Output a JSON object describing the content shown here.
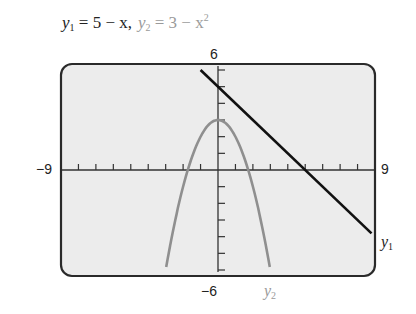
{
  "title": {
    "eq1_var": "y",
    "eq1_sub": "1",
    "eq1_rhs": " = 5 − x,",
    "eq2_var": "y",
    "eq2_sub": "2",
    "eq2_rhs": " = 3 − x",
    "eq2_sup": "2"
  },
  "window": {
    "xmin_label": "−9",
    "xmax_label": "9",
    "ymin_label": "−6",
    "ymax_label": "6"
  },
  "labels": {
    "y1_var": "y",
    "y1_sub": "1",
    "y2_var": "y",
    "y2_sub": "2"
  },
  "colors": {
    "y1": "#111111",
    "y2": "#8f8f8f",
    "screen_bg": "#ededed",
    "frame": "#2a2a2a"
  },
  "chart_data": {
    "type": "line",
    "xlabel": "",
    "ylabel": "",
    "xlim": [
      -9,
      9
    ],
    "ylim": [
      -6,
      6
    ],
    "xscale": 1,
    "yscale": 1,
    "grid": false,
    "series": [
      {
        "name": "y1",
        "equation": "y = 5 - x",
        "x": [
          -1,
          0,
          2,
          5,
          8.8
        ],
        "y": [
          6,
          5,
          3,
          0,
          -3.8
        ]
      },
      {
        "name": "y2",
        "equation": "y = 3 - x^2",
        "x": [
          -2.97,
          -2,
          -1,
          0,
          1,
          2,
          2.97
        ],
        "y": [
          -5.8,
          -1,
          2,
          3,
          2,
          -1,
          -5.8
        ]
      }
    ],
    "annotations": [
      "-9",
      "9",
      "-6",
      "6",
      "y1",
      "y2"
    ]
  }
}
